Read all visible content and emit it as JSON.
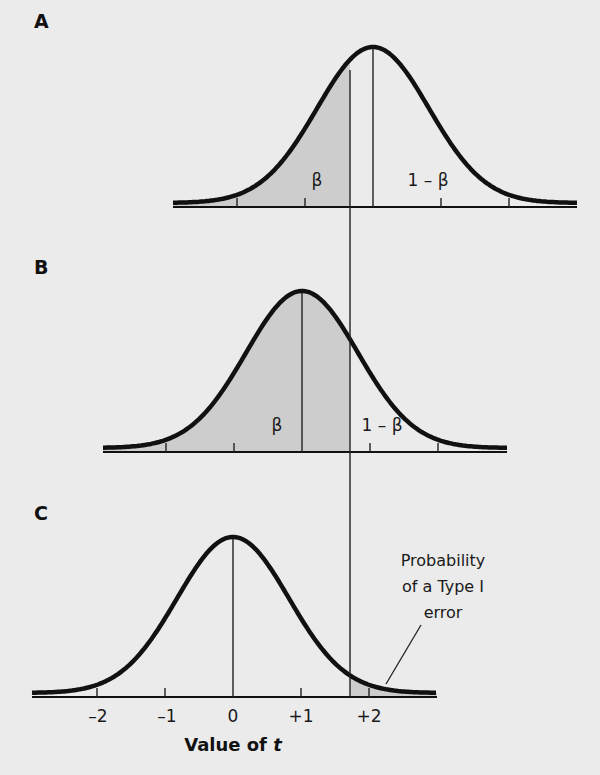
{
  "figure": {
    "background": "#ebebeb",
    "shade_color": "#cdcdcd",
    "curve_color": "#111111",
    "px_per_unit": 68,
    "sigma_px": 56,
    "critical_x_px": 350,
    "critical_top_y": 70,
    "critical_bottom_y": 697
  },
  "panels": [
    {
      "label": "A",
      "label_pos": [
        34,
        10
      ],
      "axis_y": 207,
      "x_start": 173,
      "x_end": 577,
      "mean_px": 373,
      "peak_y": 47,
      "shade": "left",
      "regions": [
        {
          "text": "β",
          "x": 317,
          "y": 170
        },
        {
          "text": "1 – β",
          "x": 428,
          "y": 170
        }
      ]
    },
    {
      "label": "B",
      "label_pos": [
        34,
        256
      ],
      "axis_y": 452,
      "x_start": 103,
      "x_end": 507,
      "mean_px": 302,
      "peak_y": 291,
      "shade": "left",
      "regions": [
        {
          "text": "β",
          "x": 277,
          "y": 415
        },
        {
          "text": "1 – β",
          "x": 382,
          "y": 415
        }
      ]
    },
    {
      "label": "C",
      "label_pos": [
        34,
        502
      ],
      "axis_y": 697,
      "x_start": 32,
      "x_end": 437,
      "mean_px": 233,
      "peak_y": 537,
      "shade": "right",
      "regions": []
    }
  ],
  "axis": {
    "tick_labels": [
      "–2",
      "–1",
      "0",
      "+1",
      "+2"
    ],
    "tick_positions_px": [
      98,
      167,
      233,
      301,
      369
    ],
    "tick_label_y": 706,
    "xlabel_prefix": "Value of ",
    "xlabel_var": "t",
    "xlabel_x": 233,
    "xlabel_y": 734
  },
  "annotation": {
    "lines": [
      "Probability",
      "of a Type I",
      "error"
    ],
    "x": 443,
    "y": 548,
    "leader": [
      [
        421,
        625
      ],
      [
        386,
        684
      ]
    ]
  },
  "chart_data": {
    "type": "diagram",
    "title": "",
    "xlabel": "Value of t",
    "ylabel": "",
    "x_ticks": [
      "-2",
      "-1",
      "0",
      "+1",
      "+2"
    ],
    "critical_t": 1.72,
    "panels": [
      {
        "label": "A",
        "distribution_mean_t": 2.05,
        "shaded_region": "t < critical",
        "shaded_label": "β",
        "unshaded_label": "1 – β"
      },
      {
        "label": "B",
        "distribution_mean_t": 1.02,
        "shaded_region": "t < critical",
        "shaded_label": "β",
        "unshaded_label": "1 – β"
      },
      {
        "label": "C",
        "distribution_mean_t": 0,
        "shaded_region": "t > critical",
        "annotation": "Probability of a Type I error"
      }
    ]
  }
}
